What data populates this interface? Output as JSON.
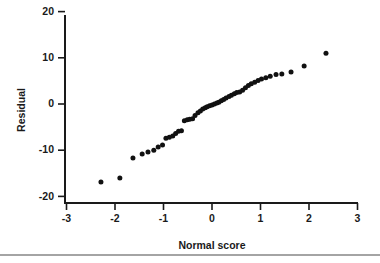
{
  "chart_data": {
    "type": "scatter",
    "title": "",
    "subtitle": "",
    "xlabel": "Normal score",
    "ylabel": "Residual",
    "xlim": [
      -3,
      3
    ],
    "ylim": [
      -20,
      20
    ],
    "xticks": [
      -3,
      -2,
      -1,
      0,
      1,
      2,
      3
    ],
    "xticklabels": [
      "-3",
      "-2",
      "-1",
      "0",
      "1",
      "2",
      "3"
    ],
    "yticks": [
      -20,
      -10,
      0,
      10,
      20
    ],
    "yticklabels": [
      "-20",
      "-10",
      "0",
      "10",
      "20"
    ],
    "grid": false,
    "legend": null,
    "marker": "filled-circle",
    "marker_color": "#111111",
    "marker_size_px": 3.2,
    "series": [
      {
        "name": "Residuals vs normal score",
        "points": [
          [
            -2.29,
            -16.9
          ],
          [
            -1.9,
            -16.0
          ],
          [
            -1.63,
            -11.7
          ],
          [
            -1.44,
            -10.8
          ],
          [
            -1.32,
            -10.4
          ],
          [
            -1.2,
            -10.0
          ],
          [
            -1.11,
            -9.3
          ],
          [
            -1.02,
            -8.9
          ],
          [
            -0.95,
            -7.4
          ],
          [
            -0.88,
            -7.2
          ],
          [
            -0.81,
            -6.9
          ],
          [
            -0.75,
            -6.4
          ],
          [
            -0.69,
            -5.9
          ],
          [
            -0.63,
            -5.8
          ],
          [
            -0.57,
            -3.6
          ],
          [
            -0.51,
            -3.4
          ],
          [
            -0.46,
            -3.3
          ],
          [
            -0.4,
            -3.2
          ],
          [
            -0.35,
            -2.5
          ],
          [
            -0.29,
            -1.9
          ],
          [
            -0.24,
            -1.5
          ],
          [
            -0.19,
            -1.1
          ],
          [
            -0.14,
            -0.8
          ],
          [
            -0.1,
            -0.6
          ],
          [
            -0.05,
            -0.4
          ],
          [
            0.0,
            -0.2
          ],
          [
            0.05,
            0.0
          ],
          [
            0.1,
            0.2
          ],
          [
            0.14,
            0.4
          ],
          [
            0.19,
            0.7
          ],
          [
            0.24,
            1.0
          ],
          [
            0.29,
            1.3
          ],
          [
            0.35,
            1.6
          ],
          [
            0.4,
            1.9
          ],
          [
            0.46,
            2.2
          ],
          [
            0.51,
            2.5
          ],
          [
            0.57,
            2.6
          ],
          [
            0.63,
            3.0
          ],
          [
            0.69,
            3.5
          ],
          [
            0.75,
            4.0
          ],
          [
            0.81,
            4.4
          ],
          [
            0.88,
            4.7
          ],
          [
            0.95,
            5.1
          ],
          [
            1.02,
            5.4
          ],
          [
            1.11,
            5.7
          ],
          [
            1.2,
            6.0
          ],
          [
            1.32,
            6.4
          ],
          [
            1.44,
            6.5
          ],
          [
            1.63,
            6.9
          ],
          [
            1.9,
            8.2
          ],
          [
            2.35,
            11.0
          ]
        ]
      }
    ]
  },
  "figure": {
    "axis_color": "#1a1a1a",
    "background_color": "#ffffff",
    "bottom_rule_color": "#4a4a4a"
  }
}
